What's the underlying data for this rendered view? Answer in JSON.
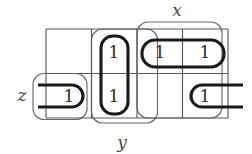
{
  "diagram": {
    "kind": "karnaugh-map",
    "title": "",
    "grid": {
      "rows": 2,
      "cols": 4,
      "left": 46,
      "right": 228,
      "top": 29,
      "bottom": 118,
      "middle_y": 73.5,
      "col_edges": [
        46,
        91.5,
        137,
        182.5,
        228
      ],
      "row_edges": [
        29,
        73.5,
        118
      ]
    },
    "cells": [
      {
        "name": "r0c0",
        "row": 0,
        "col": 0,
        "value": ""
      },
      {
        "name": "r0c1",
        "row": 0,
        "col": 1,
        "value": "1",
        "cx": 114,
        "cy": 52
      },
      {
        "name": "r0c2",
        "row": 0,
        "col": 2,
        "value": "1",
        "cx": 160,
        "cy": 52
      },
      {
        "name": "r0c3",
        "row": 0,
        "col": 3,
        "value": "1",
        "cx": 205,
        "cy": 52
      },
      {
        "name": "r1c0",
        "row": 1,
        "col": 0,
        "value": "1",
        "cx": 69,
        "cy": 96
      },
      {
        "name": "r1c1",
        "row": 1,
        "col": 1,
        "value": "1",
        "cx": 114,
        "cy": 96
      },
      {
        "name": "r1c2",
        "row": 1,
        "col": 2,
        "value": ""
      },
      {
        "name": "r1c3",
        "row": 1,
        "col": 3,
        "value": "1",
        "cx": 205,
        "cy": 96
      }
    ],
    "variable_regions": [
      {
        "name": "x",
        "label": "x",
        "label_x": 177,
        "label_y": 16,
        "shape": "rounded-rect",
        "x": 137,
        "y": 22,
        "w": 85,
        "h": 96,
        "r": 11
      },
      {
        "name": "y",
        "label": "y",
        "label_x": 120,
        "label_y": 146,
        "shape": "rounded-rect",
        "x": 91.5,
        "y": 29,
        "w": 66,
        "h": 94,
        "r": 11
      },
      {
        "name": "z",
        "label": "z",
        "label_x": 22,
        "label_y": 99,
        "shape": "rounded-rect",
        "x": 33,
        "y": 73.5,
        "w": 54,
        "h": 46,
        "r": 11
      }
    ],
    "loops": [
      {
        "name": "loop-col1-vertical",
        "cells": [
          "r0c1",
          "r1c1"
        ],
        "style": "closed",
        "x": 101,
        "y": 36,
        "w": 27,
        "h": 78,
        "r": 12
      },
      {
        "name": "loop-row0-cols23",
        "cells": [
          "r0c2",
          "r0c3"
        ],
        "style": "closed",
        "x": 142,
        "y": 40,
        "w": 82,
        "h": 27,
        "r": 13
      },
      {
        "name": "loop-r1c0-wrap-left",
        "cells": [
          "r1c0"
        ],
        "style": "open-left",
        "cap_x": 83,
        "y_top": 85,
        "y_bot": 107,
        "x_end": 38,
        "r": 11
      },
      {
        "name": "loop-r1c3-wrap-right",
        "cells": [
          "r1c3"
        ],
        "style": "open-right",
        "cap_x": 191,
        "y_top": 85,
        "y_bot": 107,
        "x_end": 243,
        "r": 11
      }
    ],
    "colors": {
      "background": "#ffffff",
      "grid_line": "#5a5a5a",
      "region_outline": "#6a6a6a",
      "loop": "#1a1a1a",
      "text": "#2b2b2b",
      "label": "#4a4a4a"
    }
  }
}
